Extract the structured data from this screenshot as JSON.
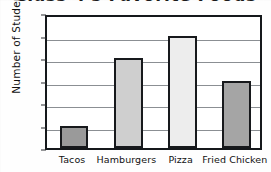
{
  "chart_data": {
    "type": "bar",
    "title": "Class 4's Favorite Foods",
    "title_clipped": true,
    "xlabel": "",
    "ylabel": "Number of Students",
    "categories": [
      "Tacos",
      "Hamburgers",
      "Pizza",
      "Fried Chicken"
    ],
    "values": [
      2,
      8,
      10,
      6
    ],
    "ylim": [
      0,
      12
    ],
    "ytick_labels": [
      "0",
      "2",
      "4",
      "6",
      "8",
      "10",
      "12"
    ],
    "ytick_values": [
      0,
      2,
      4,
      6,
      8,
      10,
      12
    ],
    "grid": true,
    "grid_axis": "y",
    "legend": null,
    "legend_position": "none",
    "series": [
      {
        "name": "Number of Students",
        "values": [
          2,
          8,
          10,
          6
        ]
      }
    ],
    "bar_colors": [
      "#9a9a9a",
      "#cfcfcf",
      "#ededed",
      "#a5a5a5"
    ],
    "bar_edge_color": "#17191c",
    "grid_color": "#8b8f93",
    "axis_color": "#15181b",
    "background_color": "#ffffff"
  }
}
